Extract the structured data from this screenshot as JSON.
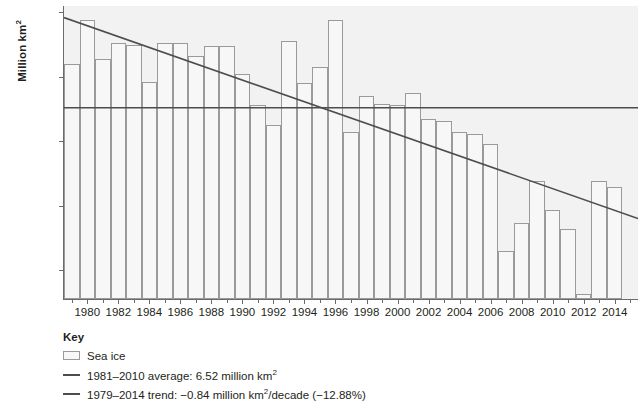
{
  "axes": {
    "y_title": "Million km",
    "y_title_sup": "2",
    "y_ticks": [
      "8.00",
      "7.00",
      "6.00",
      "5.00",
      "4.00"
    ],
    "x_ticks": [
      "1980",
      "1982",
      "1984",
      "1986",
      "1988",
      "1990",
      "1992",
      "1994",
      "1996",
      "1998",
      "2000",
      "2002",
      "2004",
      "2006",
      "2008",
      "2010",
      "2012",
      "2014"
    ]
  },
  "key": {
    "title": "Key",
    "items": [
      {
        "marker": "box",
        "label": "Sea ice",
        "sup": ""
      },
      {
        "marker": "line",
        "label": "1981–2010 average: 6.52 million km",
        "sup": "2",
        "label_after": ""
      },
      {
        "marker": "line",
        "label": "1979–2014 trend: −0.84 million km",
        "sup": "2",
        "label_after": "/decade (−12.88%)"
      }
    ]
  },
  "colors": {
    "plot_background": "#f2f2f2",
    "bar_fill": "#f7f7f7",
    "bar_stroke": "#9a9a9a",
    "line": "#4d4d4d",
    "axis": "#6b6b6b",
    "text": "#231f20"
  },
  "chart_data": {
    "type": "bar",
    "title": "",
    "xlabel": "",
    "ylabel": "Million km2",
    "ylim": [
      3.55,
      8.1
    ],
    "xlim": [
      1978.5,
      2015.5
    ],
    "grid": false,
    "legend_position": "below-left",
    "categories": [
      1979,
      1980,
      1981,
      1982,
      1983,
      1984,
      1985,
      1986,
      1987,
      1988,
      1989,
      1990,
      1991,
      1992,
      1993,
      1994,
      1995,
      1996,
      1997,
      1998,
      1999,
      2000,
      2001,
      2002,
      2003,
      2004,
      2005,
      2006,
      2007,
      2008,
      2009,
      2010,
      2011,
      2012,
      2013,
      2014
    ],
    "series": [
      {
        "name": "Sea ice",
        "values": [
          7.2,
          7.88,
          7.28,
          7.52,
          7.5,
          6.92,
          7.53,
          7.53,
          7.33,
          7.48,
          7.48,
          7.05,
          6.57,
          6.25,
          7.56,
          6.9,
          7.15,
          7.89,
          6.14,
          6.7,
          6.58,
          6.56,
          6.75,
          6.34,
          6.32,
          6.15,
          6.11,
          5.95,
          4.3,
          4.73,
          5.39,
          4.93,
          4.63,
          3.63,
          5.39,
          5.29
        ]
      }
    ],
    "reference_lines": [
      {
        "name": "1981-2010 average",
        "type": "horizontal",
        "value": 6.52,
        "label": "1981–2010 average: 6.52 million km2"
      },
      {
        "name": "1979-2014 trend",
        "type": "linear_trend",
        "slope_per_decade": -0.84,
        "percent_change": -12.88,
        "y_start": 7.92,
        "y_end": 4.8,
        "x_start": 1978.5,
        "x_end": 2015.5,
        "label": "1979–2014 trend: −0.84 million km2/decade (−12.88%)"
      }
    ]
  }
}
